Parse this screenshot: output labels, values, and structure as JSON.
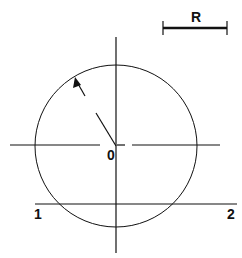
{
  "diagram": {
    "title": "",
    "labels": {
      "scale": "R",
      "center": "0",
      "line_start": "1",
      "line_end": "2"
    },
    "elements": {
      "circle": {
        "cx": 116,
        "cy": 146,
        "r": 81
      },
      "vertical_axis": {
        "x": 116,
        "y1": 37,
        "y2": 253
      },
      "horizontal_axis_segments": [
        [
          10,
          100
        ],
        [
          117,
          125
        ],
        [
          132,
          220
        ]
      ],
      "horizontal_axis_y": 145,
      "chord_line": {
        "y": 204,
        "x1": 35,
        "x2": 237
      },
      "scale_bar": {
        "x1": 163,
        "x2": 227,
        "y": 28
      }
    },
    "colors": {
      "stroke": "#111111",
      "background": "#ffffff"
    }
  }
}
